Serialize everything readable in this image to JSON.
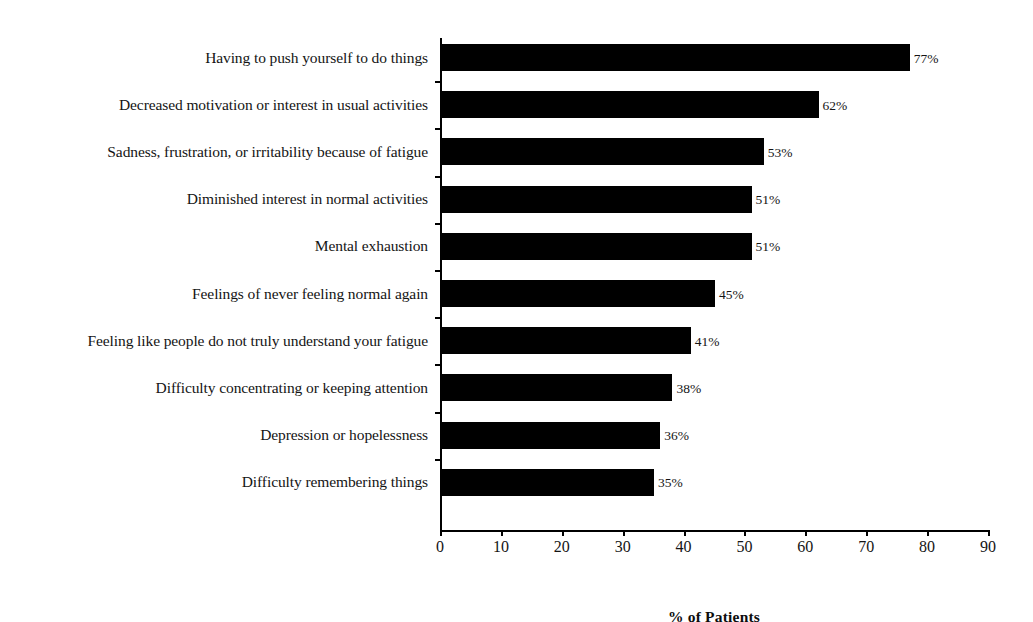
{
  "chart_data": {
    "type": "bar",
    "orientation": "horizontal",
    "title": "",
    "xlabel": "% of Patients",
    "ylabel": "",
    "xlim": [
      0,
      90
    ],
    "xticks": [
      0,
      10,
      20,
      30,
      40,
      50,
      60,
      70,
      80,
      90
    ],
    "xtick_labels": [
      "0",
      "10",
      "20",
      "30",
      "40",
      "50",
      "60",
      "70",
      "80",
      "90"
    ],
    "grid": false,
    "legend": false,
    "bar_color": "#000000",
    "categories": [
      "Having to push yourself to do things",
      "Decreased motivation or interest in usual activities",
      "Sadness, frustration, or irritability because of fatigue",
      "Diminished interest in normal activities",
      "Mental exhaustion",
      "Feelings of never feeling normal again",
      "Feeling like people do not truly understand your fatigue",
      "Difficulty concentrating or keeping attention",
      "Depression or hopelessness",
      "Difficulty remembering things"
    ],
    "values": [
      77,
      62,
      53,
      51,
      51,
      45,
      41,
      38,
      36,
      35
    ],
    "value_labels": [
      "77%",
      "62%",
      "53%",
      "51%",
      "51%",
      "45%",
      "41%",
      "38%",
      "36%",
      "35%"
    ]
  }
}
